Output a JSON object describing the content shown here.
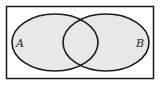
{
  "diagram": {
    "type": "venn",
    "sets": [
      {
        "label": "A"
      },
      {
        "label": "B"
      }
    ],
    "colors": {
      "fill": "#e8e8e8",
      "stroke": "#1a1a1a",
      "background": "#ffffff"
    }
  }
}
